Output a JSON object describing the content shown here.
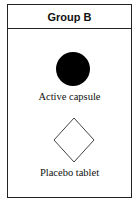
{
  "panel": {
    "title": "Group B",
    "items": [
      {
        "shape": "filled-circle",
        "label": "Active capsule",
        "color": "#000000"
      },
      {
        "shape": "outline-diamond",
        "label": "Placebo tablet",
        "color": "#444444"
      }
    ]
  }
}
